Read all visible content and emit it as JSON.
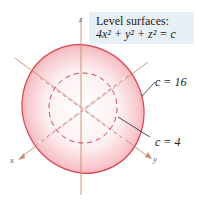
{
  "figure": {
    "caption": {
      "title": "Level surfaces:",
      "equation": "4x² + y² + z² = c"
    },
    "surfaces": [
      {
        "label": "c = 16",
        "style": "solid shaded ellipsoid"
      },
      {
        "label": "c = 4",
        "style": "dashed inner ellipsoid"
      }
    ],
    "axes": {
      "x": "x",
      "y": "y",
      "z": "z"
    },
    "colors": {
      "surface_edge": "#d9434f",
      "surface_fill": "#f3a3aa",
      "axis": "#c98a6e",
      "caption_bg": "#e9f0f5"
    }
  }
}
